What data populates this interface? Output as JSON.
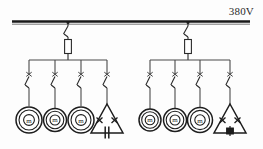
{
  "diagram": {
    "supply": {
      "voltage_label": "380V",
      "busbar_name": "main-busbar"
    },
    "feeders": [
      {
        "id": "feeder-left",
        "disconnect_switch": "knife-switch",
        "fuse": "fuse-element",
        "branches": [
          {
            "id": "branch-l1",
            "switch": "branch-switch",
            "load_type": "motor",
            "load_label": "m"
          },
          {
            "id": "branch-l2",
            "switch": "branch-switch",
            "load_type": "motor",
            "load_label": "m"
          },
          {
            "id": "branch-l3",
            "switch": "branch-switch",
            "load_type": "motor",
            "load_label": "m"
          },
          {
            "id": "branch-l4",
            "switch": "branch-switch",
            "load_type": "delta-capacitor",
            "load_label": ""
          }
        ]
      },
      {
        "id": "feeder-right",
        "disconnect_switch": "knife-switch",
        "fuse": "fuse-element",
        "branches": [
          {
            "id": "branch-r1",
            "switch": "branch-switch",
            "load_type": "motor",
            "load_label": "m"
          },
          {
            "id": "branch-r2",
            "switch": "branch-switch",
            "load_type": "motor",
            "load_label": "m"
          },
          {
            "id": "branch-r3",
            "switch": "branch-switch",
            "load_type": "motor",
            "load_label": "m"
          },
          {
            "id": "branch-r4",
            "switch": "branch-switch",
            "load_type": "delta-resistor",
            "load_label": ""
          }
        ]
      }
    ],
    "colors": {
      "line": "#2a2a2a",
      "busbar": "#1a1a1a",
      "fill": "#ffffff",
      "text": "#2b2b2b"
    }
  }
}
